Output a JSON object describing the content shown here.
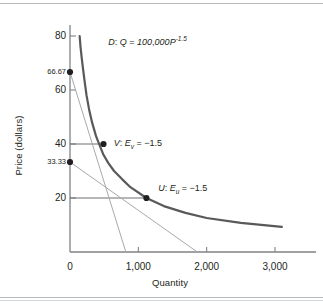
{
  "chart_data": {
    "type": "line",
    "title": "",
    "xlabel": "Quantity",
    "ylabel": "Price (dollars)",
    "xlim": [
      0,
      3400
    ],
    "ylim": [
      0,
      86
    ],
    "grid": false,
    "legend": null,
    "x_ticks": [
      {
        "value": 0,
        "label": "0"
      },
      {
        "value": 1000,
        "label": "1,000"
      },
      {
        "value": 2000,
        "label": "2,000"
      },
      {
        "value": 3000,
        "label": "3,000"
      }
    ],
    "y_ticks": [
      {
        "value": 80,
        "label": "80"
      },
      {
        "value": 66.67,
        "label": "66.67"
      },
      {
        "value": 60,
        "label": "60"
      },
      {
        "value": 40,
        "label": "40"
      },
      {
        "value": 33.33,
        "label": "33.33"
      },
      {
        "value": 20,
        "label": "20"
      }
    ],
    "series": [
      {
        "name": "D",
        "kind": "demand-curve",
        "equation": "Q = 100,000P^-1.5",
        "label": "D: Q = 100,000P",
        "exponent": "-1.5",
        "color": "#58595b",
        "points": [
          {
            "q": 141,
            "p": 80
          },
          {
            "q": 154,
            "p": 76
          },
          {
            "q": 171,
            "p": 72
          },
          {
            "q": 190,
            "p": 68
          },
          {
            "q": 215,
            "p": 63
          },
          {
            "q": 242,
            "p": 58
          },
          {
            "q": 278,
            "p": 53
          },
          {
            "q": 323,
            "p": 48
          },
          {
            "q": 380,
            "p": 43
          },
          {
            "q": 395,
            "p": 42
          },
          {
            "q": 490,
            "p": 36
          },
          {
            "q": 559,
            "p": 33
          },
          {
            "q": 645,
            "p": 30
          },
          {
            "q": 761,
            "p": 27
          },
          {
            "q": 884,
            "p": 24
          },
          {
            "q": 1118,
            "p": 20
          },
          {
            "q": 1373,
            "p": 17
          },
          {
            "q": 1690,
            "p": 14.5
          },
          {
            "q": 2000,
            "p": 12.6
          },
          {
            "q": 2500,
            "p": 10.8
          },
          {
            "q": 3100,
            "p": 9.3
          }
        ]
      },
      {
        "name": "tangent-V",
        "kind": "tangent-line",
        "color": "#a7a9ac",
        "from": {
          "q": 0,
          "p": 66.67
        },
        "to": {
          "q": 817,
          "p": 0
        }
      },
      {
        "name": "tangent-U",
        "kind": "tangent-line",
        "color": "#a7a9ac",
        "from": {
          "q": 0,
          "p": 33.33
        },
        "to": {
          "q": 1863,
          "p": 0
        }
      }
    ],
    "annotations": [
      {
        "name": "demand-curve-equation",
        "text": "D: Q = 100,000P",
        "sup": "-1.5",
        "q": 560,
        "p": 78
      },
      {
        "name": "point-v-label",
        "text": "V: E",
        "sub": "v",
        "tail": " = -1.5",
        "q": 640,
        "p": 40
      },
      {
        "name": "point-u-label",
        "text": "U: E",
        "sub": "u",
        "tail": " = -1.5",
        "q": 1290,
        "p": 23.5
      }
    ],
    "markers": [
      {
        "name": "y-intercept-v",
        "q": 0,
        "p": 66.67,
        "label": "66.67"
      },
      {
        "name": "point-v",
        "q": 490,
        "p": 40,
        "label": "V"
      },
      {
        "name": "y-intercept-u",
        "q": 0,
        "p": 33.33,
        "label": "33.33"
      },
      {
        "name": "point-u",
        "q": 1118,
        "p": 20,
        "label": "U"
      }
    ],
    "guide_lines": [
      {
        "name": "guide-p40",
        "from": {
          "q": 0,
          "p": 40
        },
        "to": {
          "q": 490,
          "p": 40
        }
      },
      {
        "name": "guide-p20",
        "from": {
          "q": 0,
          "p": 20
        },
        "to": {
          "q": 1118,
          "p": 20
        }
      }
    ],
    "colors": {
      "curve": "#58595b",
      "tangent": "#a7a9ac",
      "axis": "#808285",
      "guide": "#6d6e71",
      "marker": "#231f20",
      "text": "#231f20"
    }
  }
}
